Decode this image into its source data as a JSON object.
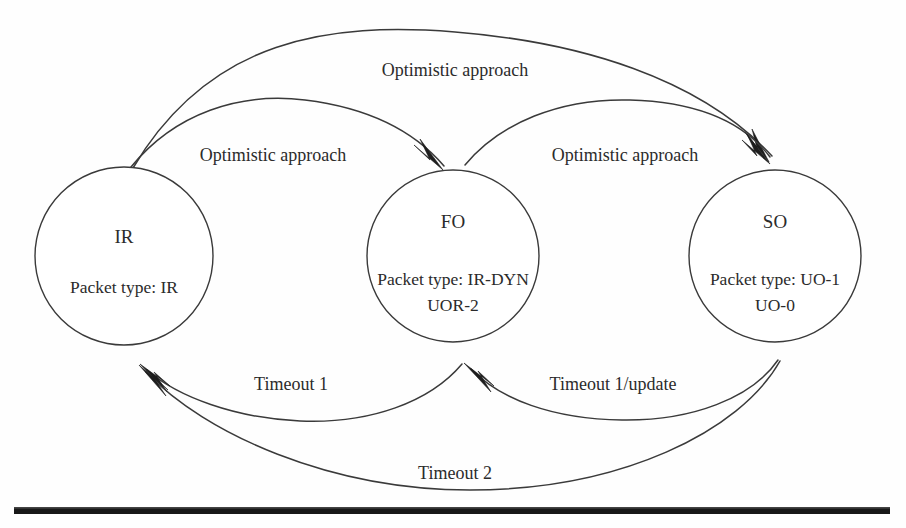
{
  "diagram": {
    "type": "state-machine",
    "background_color": "#fefefe",
    "line_color": "#3a3a3a",
    "text_color": "#2b2b2b",
    "states": [
      {
        "id": "IR",
        "name": "IR",
        "packet_line_1": "Packet type: IR",
        "packet_line_2": "",
        "cx": 124,
        "cy": 256,
        "r": 89
      },
      {
        "id": "FO",
        "name": "FO",
        "packet_line_1": "Packet type: IR-DYN",
        "packet_line_2": "UOR-2",
        "cx": 453,
        "cy": 256,
        "r": 86
      },
      {
        "id": "SO",
        "name": "SO",
        "packet_line_1": "Packet type: UO-1",
        "packet_line_2": "UO-0",
        "cx": 775,
        "cy": 256,
        "r": 86
      }
    ],
    "transitions": [
      {
        "id": "ir-to-so",
        "from": "IR",
        "to": "SO",
        "label": "Optimistic approach",
        "label_x": 455,
        "label_y": 76,
        "direction": "forward"
      },
      {
        "id": "ir-to-fo",
        "from": "IR",
        "to": "FO",
        "label": "Optimistic approach",
        "label_x": 273,
        "label_y": 161,
        "direction": "forward"
      },
      {
        "id": "fo-to-so",
        "from": "FO",
        "to": "SO",
        "label": "Optimistic approach",
        "label_x": 625,
        "label_y": 161,
        "direction": "forward"
      },
      {
        "id": "fo-to-ir",
        "from": "FO",
        "to": "IR",
        "label": "Timeout 1",
        "label_x": 291,
        "label_y": 390,
        "direction": "backward"
      },
      {
        "id": "so-to-fo",
        "from": "SO",
        "to": "FO",
        "label": "Timeout 1/update",
        "label_x": 613,
        "label_y": 390,
        "direction": "backward"
      },
      {
        "id": "so-to-ir",
        "from": "SO",
        "to": "IR",
        "label": "Timeout 2",
        "label_x": 455,
        "label_y": 479,
        "direction": "backward"
      }
    ],
    "bottom_rule": {
      "name": "horizontal-rule",
      "color": "#181818"
    }
  }
}
